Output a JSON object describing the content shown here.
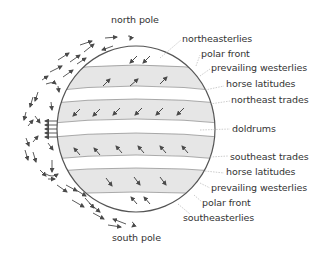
{
  "diagram": {
    "colors": {
      "outline": "#555555",
      "band_fill": "#e6e6e6",
      "arrow": "#4a4a4a",
      "leader": "#aaaaaa",
      "text": "#333333"
    },
    "poles": {
      "north": "north pole",
      "south": "south pole"
    },
    "labels": [
      {
        "id": "northeasterlies",
        "text": "northeasterlies"
      },
      {
        "id": "polar-front-north",
        "text": "polar front"
      },
      {
        "id": "prevailing-westerlies-north",
        "text": "prevailing westerlies"
      },
      {
        "id": "horse-latitudes-north",
        "text": "horse latitudes"
      },
      {
        "id": "northeast-trades",
        "text": "northeast trades"
      },
      {
        "id": "doldrums",
        "text": "doldrums"
      },
      {
        "id": "southeast-trades",
        "text": "southeast trades"
      },
      {
        "id": "horse-latitudes-south",
        "text": "horse latitudes"
      },
      {
        "id": "prevailing-westerlies-south",
        "text": "prevailing westerlies"
      },
      {
        "id": "polar-front-south",
        "text": "polar front"
      },
      {
        "id": "southeasterlies",
        "text": "southeasterlies"
      }
    ],
    "icons": {
      "surface_wind": "arrow-icon",
      "circulation_cell": "circulation-arrow-icon"
    }
  }
}
